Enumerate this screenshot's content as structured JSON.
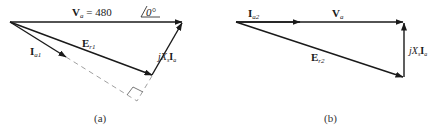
{
  "diagram_a": {
    "caption": "(a)",
    "labels": {
      "va_main": "V",
      "va_sub": "a",
      "va_value": " = 480",
      "va_angle": "0°",
      "ia1_main": "I",
      "ia1_sub": "a1",
      "er1_main": "E",
      "er1_sub": "r1",
      "jxs_j": "jX",
      "jxs_sub": "s",
      "jxs_i": "I",
      "jxs_isub": "a"
    }
  },
  "diagram_b": {
    "caption": "(b)",
    "labels": {
      "ia2_main": "I",
      "ia2_sub": "a2",
      "va_main": "V",
      "va_sub": "a",
      "er2_main": "E",
      "er2_sub": "r2",
      "jxs_j": "jX",
      "jxs_sub": "s",
      "jxs_i": "I",
      "jxs_isub": "a"
    }
  },
  "colors": {
    "stroke": "#1a1a1a",
    "dashed": "#888888"
  }
}
